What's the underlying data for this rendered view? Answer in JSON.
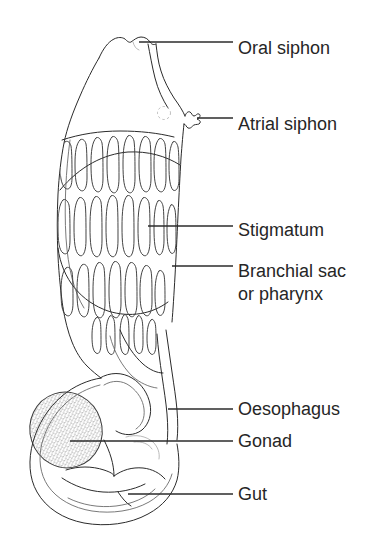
{
  "figure": {
    "background_color": "#ffffff",
    "ink_color": "#2b2b2b",
    "text_color": "#262626",
    "width": 378,
    "height": 546,
    "style": "black-and-white line drawing with leader-line callouts"
  },
  "labels": [
    {
      "id": "oral-siphon",
      "text": "Oral siphon",
      "text_x": 238,
      "text_y": 54,
      "leader_x1": 139,
      "leader_y1": 42,
      "leader_x2": 233,
      "leader_y2": 42,
      "lines": [
        "Oral siphon"
      ]
    },
    {
      "id": "atrial-siphon",
      "text": "Atrial siphon",
      "text_x": 238,
      "text_y": 130,
      "leader_x1": 197,
      "leader_y1": 118,
      "leader_x2": 233,
      "leader_y2": 118,
      "lines": [
        "Atrial siphon"
      ]
    },
    {
      "id": "stigmatum",
      "text": "Stigmatum",
      "text_x": 238,
      "text_y": 236,
      "leader_x1": 148,
      "leader_y1": 226,
      "leader_x2": 233,
      "leader_y2": 226,
      "lines": [
        "Stigmatum"
      ]
    },
    {
      "id": "branchial-sac",
      "text": "Branchial sac or pharynx",
      "text_x": 238,
      "text_y": 277,
      "leader_x1": 172,
      "leader_y1": 266,
      "leader_x2": 233,
      "leader_y2": 266,
      "lines": [
        "Branchial sac",
        "or pharynx"
      ]
    },
    {
      "id": "oesophagus",
      "text": "Oesophagus",
      "text_x": 238,
      "text_y": 415,
      "leader_x1": 168,
      "leader_y1": 409,
      "leader_x2": 233,
      "leader_y2": 409,
      "lines": [
        "Oesophagus"
      ]
    },
    {
      "id": "gonad",
      "text": "Gonad",
      "text_x": 238,
      "text_y": 447,
      "leader_x1": 70,
      "leader_y1": 441,
      "leader_x2": 233,
      "leader_y2": 441,
      "lines": [
        "Gonad"
      ]
    },
    {
      "id": "gut",
      "text": "Gut",
      "text_x": 238,
      "text_y": 500,
      "leader_x1": 128,
      "leader_y1": 494,
      "leader_x2": 233,
      "leader_y2": 494,
      "lines": [
        "Gut"
      ]
    }
  ],
  "anatomy": {
    "oral_siphon_note": "rounded opening at top apex of body",
    "atrial_siphon_note": "lateral jagged opening on right side",
    "branchial_sac_note": "large perforated pharynx occupying upper body",
    "stigmata_rows": 3,
    "stigmata_per_row": 8,
    "gonad_note": "stippled oval mass at lower left",
    "gut_note": "looped lobed mass at base"
  }
}
